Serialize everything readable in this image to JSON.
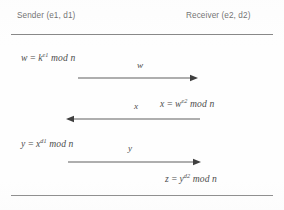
{
  "diagram": {
    "line_color": "#7d7d7d",
    "text_color": "#4d4d4d",
    "background": "#fefefe",
    "header": {
      "sender_label": "Sender (e1, d1)",
      "receiver_label": "Receiver (e2, d2)"
    },
    "equations": [
      {
        "id": "eq-w",
        "side": "sender",
        "lhs": "w",
        "rel": "=",
        "base": "k",
        "exponent": "e1",
        "operator": "mod",
        "modulus": "n",
        "full_text": "w = k^e1 mod n"
      },
      {
        "id": "eq-x",
        "side": "receiver",
        "lhs": "x",
        "rel": "=",
        "base": "w",
        "exponent": "e2",
        "operator": "mod",
        "modulus": "n",
        "full_text": "x = w^e2 mod n"
      },
      {
        "id": "eq-y",
        "side": "sender",
        "lhs": "y",
        "rel": "=",
        "base": "x",
        "exponent": "d1",
        "operator": "mod",
        "modulus": "n",
        "full_text": "y = x^d1 mod n"
      },
      {
        "id": "eq-z",
        "side": "receiver",
        "lhs": "z",
        "rel": "=",
        "base": "y",
        "exponent": "d2",
        "operator": "mod",
        "modulus": "n",
        "full_text": "z = y^d2 mod n"
      }
    ],
    "messages": [
      {
        "id": "msg-w",
        "label": "w",
        "direction": "sender-to-receiver"
      },
      {
        "id": "msg-x",
        "label": "x",
        "direction": "receiver-to-sender"
      },
      {
        "id": "msg-y",
        "label": "y",
        "direction": "sender-to-receiver"
      }
    ]
  }
}
